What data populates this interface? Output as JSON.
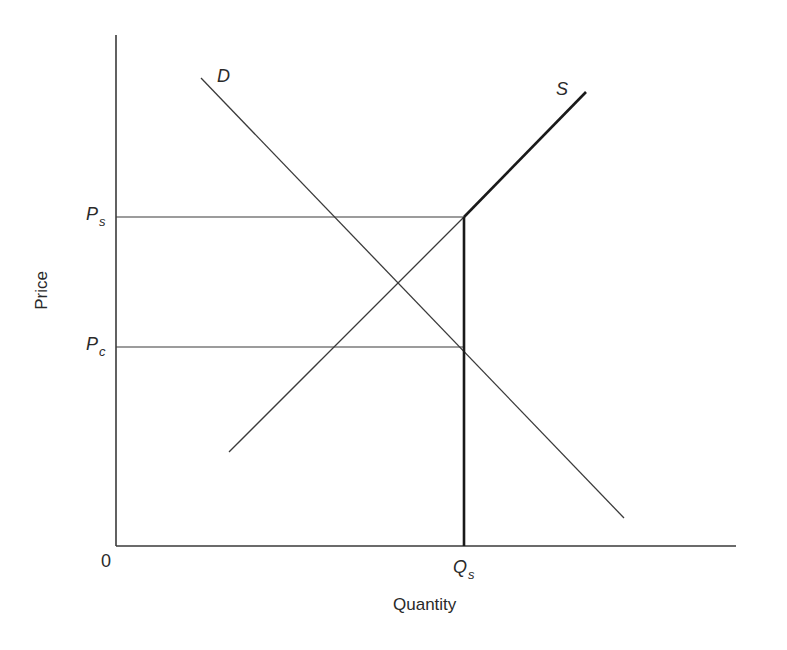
{
  "diagram": {
    "type": "supply-demand price-support diagram",
    "axes": {
      "x_title": "Quantity",
      "y_title": "Price",
      "origin_label": "0"
    },
    "curves": {
      "demand": {
        "label": "D",
        "from": [
          201,
          78
        ],
        "to": [
          624,
          518
        ]
      },
      "supply": {
        "label": "S",
        "from": [
          229,
          452
        ],
        "kink": [
          464,
          217
        ],
        "to": [
          586,
          92
        ]
      }
    },
    "price_levels": [
      {
        "id": "ps",
        "main": "P",
        "sub": "s",
        "y": 217
      },
      {
        "id": "pc",
        "main": "P",
        "sub": "c",
        "y": 347
      }
    ],
    "quantity_levels": [
      {
        "id": "qs",
        "main": "Q",
        "sub": "s",
        "x": 464
      }
    ],
    "colors": {
      "line": "#3a3a3a",
      "thick_line": "#1a1a1a",
      "background": "#ffffff"
    }
  }
}
